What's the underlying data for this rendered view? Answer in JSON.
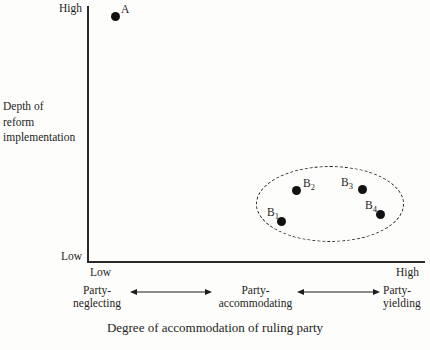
{
  "figure": {
    "type": "scatter",
    "background_color": "#fdfdfb",
    "ink_color": "#1d1d1d"
  },
  "y_axis": {
    "title_line_1": "Depth of",
    "title_line_2": "reform",
    "title_line_3": "implementation",
    "high_label": "High",
    "low_label": "Low"
  },
  "x_axis": {
    "title": "Degree of accommodation of ruling party",
    "low_label": "Low",
    "high_label": "High"
  },
  "regimes": [
    {
      "line1": "Party-",
      "line2": "neglecting"
    },
    {
      "line1": "Party-",
      "line2": "accommodating"
    },
    {
      "line1": "Party-",
      "line2": "yielding"
    }
  ],
  "points": [
    {
      "label": "A",
      "sub": "",
      "x": 115,
      "y": 16
    },
    {
      "label": "B",
      "sub": "1",
      "x": 281,
      "y": 221
    },
    {
      "label": "B",
      "sub": "2",
      "x": 296,
      "y": 190
    },
    {
      "label": "B",
      "sub": "3",
      "x": 362,
      "y": 189
    },
    {
      "label": "B",
      "sub": "4",
      "x": 380,
      "y": 214
    }
  ],
  "cluster": {
    "name": "B-cluster",
    "style": "dashed-ellipse",
    "center_x": 330,
    "center_y": 204,
    "radius_x": 74,
    "radius_y": 38
  },
  "chart_data": {
    "type": "scatter",
    "title": "",
    "xlabel": "Degree of accommodation of ruling party",
    "ylabel": "Depth of reform implementation",
    "xlim": [
      "Low",
      "High"
    ],
    "ylim": [
      "Low",
      "High"
    ],
    "grid": false,
    "legend": "none",
    "x_categories": [
      "Party-neglecting",
      "Party-accommodating",
      "Party-yielding"
    ],
    "series": [
      {
        "name": "A",
        "points": [
          {
            "label": "A",
            "x_qualitative": "Low",
            "y_qualitative": "High",
            "x_rel": 0.08,
            "y_rel": 0.96
          }
        ]
      },
      {
        "name": "B-cluster",
        "enclosed_by": "dashed ellipse",
        "points": [
          {
            "label": "B1",
            "x_qualitative": "Party-accommodating",
            "y_qualitative": "Low-Mid",
            "x_rel": 0.57,
            "y_rel": 0.16
          },
          {
            "label": "B2",
            "x_qualitative": "Party-accommodating",
            "y_qualitative": "Low-Mid",
            "x_rel": 0.62,
            "y_rel": 0.28
          },
          {
            "label": "B3",
            "x_qualitative": "Party-yielding",
            "y_qualitative": "Low-Mid",
            "x_rel": 0.81,
            "y_rel": 0.29
          },
          {
            "label": "B4",
            "x_qualitative": "Party-yielding",
            "y_qualitative": "Low",
            "x_rel": 0.87,
            "y_rel": 0.19
          }
        ]
      }
    ],
    "annotations": [
      {
        "text": "Party-neglecting",
        "position": "x-axis-left"
      },
      {
        "text": "Party-accommodating",
        "position": "x-axis-center"
      },
      {
        "text": "Party-yielding",
        "position": "x-axis-right"
      }
    ]
  }
}
